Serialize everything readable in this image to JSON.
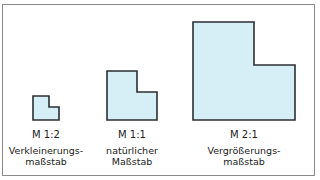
{
  "figure": {
    "items": [
      {
        "scale": "M 1:2",
        "desc_line1": "Verkleinerungs-",
        "desc_line2": "maßstab"
      },
      {
        "scale": "M 1:1",
        "desc_line1": "natürlicher",
        "desc_line2": "Maßstab"
      },
      {
        "scale": "M 2:1",
        "desc_line1": "Vergrößerungs-",
        "desc_line2": "maßstab"
      }
    ],
    "colors": {
      "fill": "#d6eef6",
      "stroke": "#2b2f33",
      "frame": "#8a8a8a"
    }
  }
}
